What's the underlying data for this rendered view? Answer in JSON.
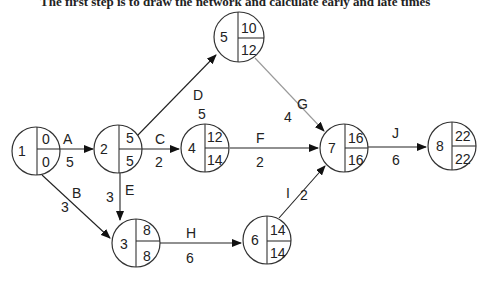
{
  "caption": "The first step is to draw the network and calculate early and late times",
  "diagram": {
    "type": "activity-on-node network (critical path)",
    "nodes": [
      {
        "id": "1",
        "cx": 36,
        "cy": 151,
        "es": "0",
        "lf": "0"
      },
      {
        "id": "2",
        "cx": 118,
        "cy": 149,
        "es": "5",
        "lf": "5"
      },
      {
        "id": "3",
        "cx": 136,
        "cy": 243,
        "es": "8",
        "lf": "8"
      },
      {
        "id": "4",
        "cx": 205,
        "cy": 148,
        "es": "12",
        "lf": "14"
      },
      {
        "id": "5",
        "cx": 239,
        "cy": 37,
        "es": "10",
        "lf": "12"
      },
      {
        "id": "6",
        "cx": 267,
        "cy": 240,
        "es": "14",
        "lf": "14"
      },
      {
        "id": "7",
        "cx": 344,
        "cy": 148,
        "es": "16",
        "lf": "16"
      },
      {
        "id": "8",
        "cx": 452,
        "cy": 146,
        "es": "22",
        "lf": "22"
      }
    ],
    "edges": [
      {
        "activity": "A",
        "duration": "5",
        "from": "1",
        "to": "2"
      },
      {
        "activity": "B",
        "duration": "3",
        "from": "1",
        "to": "3"
      },
      {
        "activity": "C",
        "duration": "2",
        "from": "2",
        "to": "4"
      },
      {
        "activity": "D",
        "duration": "5",
        "from": "2",
        "to": "5"
      },
      {
        "activity": "E",
        "duration": "3",
        "from": "2",
        "to": "3"
      },
      {
        "activity": "F",
        "duration": "2",
        "from": "4",
        "to": "7"
      },
      {
        "activity": "G",
        "duration": "4",
        "from": "5",
        "to": "7"
      },
      {
        "activity": "H",
        "duration": "6",
        "from": "3",
        "to": "6"
      },
      {
        "activity": "I",
        "duration": "2",
        "from": "6",
        "to": "7"
      },
      {
        "activity": "J",
        "duration": "6",
        "from": "7",
        "to": "8"
      }
    ]
  },
  "colors": {
    "stroke": "#333333",
    "arrow": "#222222",
    "arrow_light": "#9a9a9a",
    "background": "#ffffff"
  }
}
